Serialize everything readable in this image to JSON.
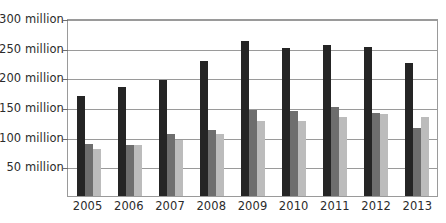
{
  "chart_data": {
    "type": "bar",
    "title": "",
    "xlabel": "",
    "ylabel": "",
    "categories": [
      "2005",
      "2006",
      "2007",
      "2008",
      "2009",
      "2010",
      "2011",
      "2012",
      "2013"
    ],
    "series": [
      {
        "name": "series-1-dark",
        "color": "#252525",
        "values": [
          168,
          183,
          196,
          228,
          262,
          250,
          255,
          251,
          225
        ]
      },
      {
        "name": "series-2-medium",
        "color": "#6e6e6e",
        "values": [
          88,
          86,
          105,
          112,
          145,
          143,
          150,
          140,
          115
        ]
      },
      {
        "name": "series-3-light",
        "color": "#bcbcbc",
        "values": [
          80,
          86,
          95,
          105,
          127,
          127,
          133,
          138,
          133
        ]
      }
    ],
    "ylim": [
      0,
      300
    ],
    "ytick_values": [
      50,
      100,
      150,
      200,
      250,
      300
    ],
    "ytick_labels": [
      "50 million",
      "100 million",
      "150 million",
      "200 million",
      "250 million",
      "300 million"
    ],
    "grid": true,
    "legend": null
  }
}
